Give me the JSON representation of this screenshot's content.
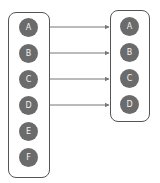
{
  "colors": {
    "node_fill": "#6b6b6b",
    "node_text": "#f2f2f2",
    "box_border": "#555555",
    "arrow": "#777777"
  },
  "left_group": {
    "nodes": [
      {
        "label": "A"
      },
      {
        "label": "B"
      },
      {
        "label": "C"
      },
      {
        "label": "D"
      },
      {
        "label": "E"
      },
      {
        "label": "F"
      }
    ]
  },
  "right_group": {
    "nodes": [
      {
        "label": "A"
      },
      {
        "label": "B"
      },
      {
        "label": "C"
      },
      {
        "label": "D"
      }
    ]
  },
  "edges": [
    {
      "from": "left.A",
      "to": "right.A"
    },
    {
      "from": "left.B",
      "to": "right.B"
    },
    {
      "from": "left.C",
      "to": "right.C"
    },
    {
      "from": "left.D",
      "to": "right.D"
    }
  ]
}
